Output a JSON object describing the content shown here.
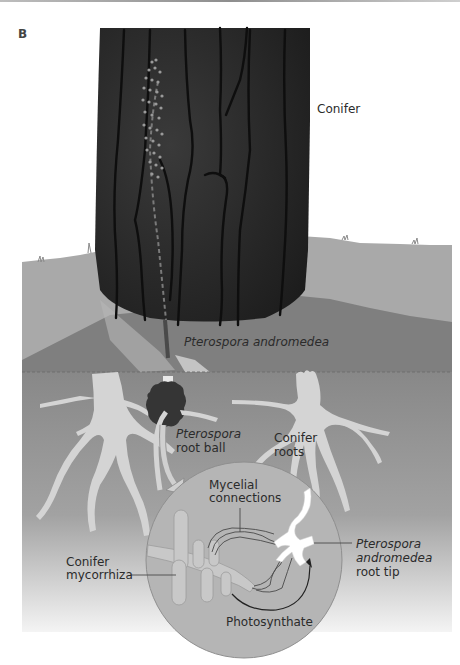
{
  "figure": {
    "panel_label": "B",
    "colors": {
      "background": "#ffffff",
      "trunk": "#2a2a2a",
      "trunk_cracks": "#111111",
      "ground_far": "#a9a9a9",
      "ground_mid": "#7f7f7f",
      "soil_top": "#8a8a8a",
      "soil_bottom": "#f2f2f2",
      "roots": "#d4d4d4",
      "root_ball": "#353535",
      "inset_circle": "#b5b5b5",
      "mycorrhiza": "#c8c8c8",
      "root_tip": "#ffffff",
      "text": "#2b2b2b"
    },
    "labels": {
      "conifer": "Conifer",
      "pterospora_andromedea": "Pterospora andromedea",
      "pterospora_root_ball_line1": "Pterospora",
      "pterospora_root_ball_line2": "root ball",
      "conifer_roots_line1": "Conifer",
      "conifer_roots_line2": "roots",
      "mycelial_connections_line1": "Mycelial",
      "mycelial_connections_line2": "connections",
      "conifer_mycorrhiza_line1": "Conifer",
      "conifer_mycorrhiza_line2": "mycorrhiza",
      "root_tip_line1": "Pterospora",
      "root_tip_line2": "andromedea",
      "root_tip_line3": "root tip",
      "photosynthate": "Photosynthate"
    }
  }
}
